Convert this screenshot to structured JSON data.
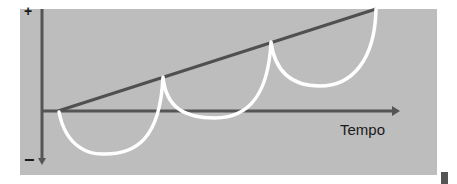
{
  "diagram": {
    "x_axis_label": "Tempo",
    "y_axis_positive_sign": "+",
    "y_axis_negative_sign": "−",
    "colors": {
      "background": "#bdbdbd",
      "axis": "#555555",
      "trend_line": "#505050",
      "curve": "#ffffff",
      "text": "#1a1a1a"
    },
    "elements": {
      "trend_line": "straight rising line from origin",
      "oscillating_curve": "three scalloped arcs dipping below the trend line, touching it at cusps"
    }
  }
}
